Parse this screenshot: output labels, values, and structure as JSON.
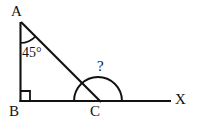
{
  "figure": {
    "type": "geometry-diagram",
    "background_color": "#ffffff",
    "stroke_color": "#111111",
    "width": 197,
    "height": 127
  },
  "vertices": {
    "a": {
      "label": "A",
      "x": 20,
      "y": 22
    },
    "b": {
      "label": "B",
      "x": 20,
      "y": 101
    },
    "c": {
      "label": "C",
      "x": 100,
      "y": 101
    },
    "x": {
      "label": "X",
      "x": 171,
      "y": 101
    }
  },
  "angles": {
    "at_a": {
      "label": "45°",
      "value": 45,
      "unit": "degrees",
      "marker": "arc"
    },
    "at_b": {
      "label": "",
      "value": 90,
      "unit": "degrees",
      "marker": "right-angle-square"
    },
    "at_c": {
      "label": "?",
      "value": null,
      "unit": "degrees",
      "marker": "arc"
    }
  },
  "segments": [
    {
      "name": "segment-ab",
      "from": "A",
      "to": "B"
    },
    {
      "name": "segment-ac",
      "from": "A",
      "to": "C"
    },
    {
      "name": "ray-bx",
      "from": "B",
      "to": "X"
    }
  ]
}
